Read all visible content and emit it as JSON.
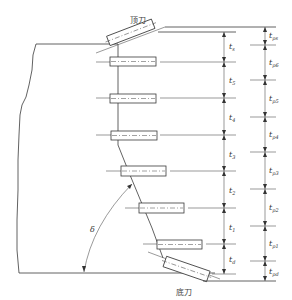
{
  "diagram": {
    "labels": {
      "top_knife": "顶刀",
      "bottom_knife": "底刀",
      "angle": "δ"
    },
    "colors": {
      "line": "#3a3a3a",
      "background": "#ffffff"
    },
    "left_dimensions": [
      {
        "base": "t",
        "sub": "s"
      },
      {
        "base": "t",
        "sub": "5"
      },
      {
        "base": "t",
        "sub": "4"
      },
      {
        "base": "t",
        "sub": "3"
      },
      {
        "base": "t",
        "sub": "2"
      },
      {
        "base": "t",
        "sub": "1"
      },
      {
        "base": "t",
        "sub": "d"
      }
    ],
    "right_dimensions": [
      {
        "base": "t",
        "sub": "ps"
      },
      {
        "base": "t",
        "sub": "p6"
      },
      {
        "base": "t",
        "sub": "p5"
      },
      {
        "base": "t",
        "sub": "p4"
      },
      {
        "base": "t",
        "sub": "p3"
      },
      {
        "base": "t",
        "sub": "p2"
      },
      {
        "base": "t",
        "sub": "p1"
      },
      {
        "base": "t",
        "sub": "pd"
      }
    ]
  }
}
